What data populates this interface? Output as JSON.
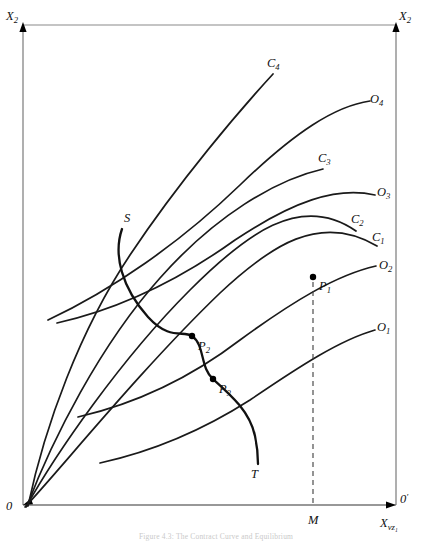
{
  "figure": {
    "type": "edgeworth-box-diagram",
    "caption": "Figure 4.3:  The Contract Curve and Equilibrium",
    "axes": {
      "left_vertical_label": "X",
      "left_vertical_sub": "2",
      "right_vertical_label": "X",
      "right_vertical_sub": "2",
      "horizontal_label": "X",
      "horizontal_sub": "vz₁",
      "origin_left": "0",
      "origin_right": "0",
      "origin_right_prime": "′"
    },
    "curve_labels": {
      "c1": "C",
      "c1_sub": "1",
      "c2": "C",
      "c2_sub": "2",
      "c3": "C",
      "c3_sub": "3",
      "c4": "C",
      "c4_sub": "4",
      "o1": "O",
      "o1_sub": "1",
      "o2": "O",
      "o2_sub": "2",
      "o3": "O",
      "o3_sub": "3",
      "o4": "O",
      "o4_sub": "4"
    },
    "contract_curve": {
      "start_label": "S",
      "end_label": "T"
    },
    "points": [
      {
        "name": "P",
        "sub": "1",
        "x": 313,
        "y": 277
      },
      {
        "name": "P",
        "sub": "2",
        "x": 192,
        "y": 336
      },
      {
        "name": "P",
        "sub": "3",
        "x": 213,
        "y": 379
      }
    ],
    "marker": {
      "label": "M",
      "x": 313
    },
    "colors": {
      "curve": "#1a1a1a",
      "axis": "#6d6d6d",
      "box": "#8a8a8a",
      "dashed": "#3c3c3c",
      "background": "#ffffff"
    }
  }
}
